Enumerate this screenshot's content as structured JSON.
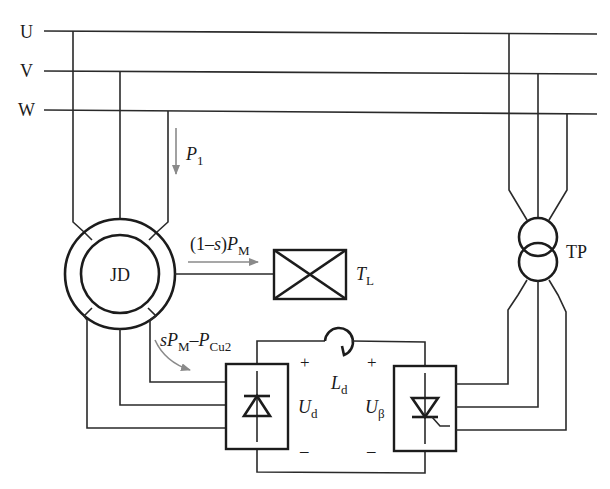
{
  "diagram": {
    "type": "circuit-schematic",
    "bus_labels": [
      "U",
      "V",
      "W"
    ],
    "motor": {
      "label": "JD"
    },
    "load": {
      "label_main": "T",
      "label_sub": "L"
    },
    "transformer": {
      "label": "TP"
    },
    "inductor": {
      "label_main": "L",
      "label_sub": "d"
    },
    "rectifier": {
      "voltage_main": "U",
      "voltage_sub": "d",
      "plus": "+",
      "minus": "–"
    },
    "inverter": {
      "voltage_main": "U",
      "voltage_sub": "β",
      "plus": "+",
      "minus": "–"
    },
    "power_flows": {
      "input": {
        "main": "P",
        "sub": "1"
      },
      "mechanical": {
        "prefix": "(1–",
        "var": "s",
        "mid": ")",
        "main": "P",
        "sub": "M"
      },
      "slip": {
        "var": "s",
        "main1": "P",
        "sub1": "M",
        "dash": "–",
        "main2": "P",
        "sub2": "Cu2"
      }
    },
    "colors": {
      "line": "#2a2a2a",
      "flow_arrow": "#8a8a8a",
      "background": "#ffffff"
    }
  }
}
